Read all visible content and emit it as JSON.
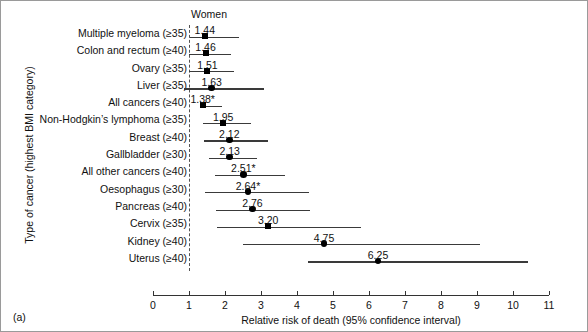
{
  "figure": {
    "panel_label": "(a)",
    "column_header": "Women",
    "y_axis_title": "Type of cancer (highest BMI category)",
    "x_axis_title": "Relative risk of death (95% confidence interval)"
  },
  "chart_data": {
    "type": "scatter",
    "title": "Women",
    "xlabel": "Relative risk of death (95% confidence interval)",
    "ylabel": "Type of cancer (highest BMI category)",
    "xlim": [
      0,
      11
    ],
    "xticks": [
      0,
      1,
      2,
      3,
      4,
      5,
      6,
      7,
      8,
      9,
      10,
      11
    ],
    "xtick_labels": [
      "0",
      "1",
      "2",
      "3",
      "4",
      "5",
      "6",
      "7",
      "8",
      "9",
      "10",
      "11"
    ],
    "grid": false,
    "legend": "none",
    "reference_line": 1.0,
    "categories": [
      "Multiple myeloma (≥35)",
      "Colon and rectum (≥40)",
      "Ovary (≥35)",
      "Liver (≥35)",
      "All cancers (≥40)",
      "Non-Hodgkin’s lymphoma (≥35)",
      "Breast (≥40)",
      "Gallbladder (≥30)",
      "All other cancers (≥40)",
      "Oesophagus (≥30)",
      "Pancreas (≥40)",
      "Cervix (≥35)",
      "Kidney (≥40)",
      "Uterus (≥40)"
    ],
    "points": [
      {
        "label": "Multiple myeloma (≥35)",
        "value": 1.44,
        "value_label": "1.44",
        "ci_low": 1.03,
        "ci_high": 2.39,
        "marker": "square"
      },
      {
        "label": "Colon and rectum (≥40)",
        "value": 1.46,
        "value_label": "1.46",
        "ci_low": 1.01,
        "ci_high": 2.16,
        "marker": "square"
      },
      {
        "label": "Ovary (≥35)",
        "value": 1.51,
        "value_label": "1.51",
        "ci_low": 1.01,
        "ci_high": 2.26,
        "marker": "square"
      },
      {
        "label": "Liver (≥35)",
        "value": 1.63,
        "value_label": "1.63",
        "ci_low": 0.87,
        "ci_high": 3.08,
        "marker": "circle"
      },
      {
        "label": "All cancers (≥40)",
        "value": 1.38,
        "value_label": "1.38*",
        "ci_low": 1.32,
        "ci_high": 1.91,
        "marker": "square"
      },
      {
        "label": "Non-Hodgkin’s lymphoma (≥35)",
        "value": 1.95,
        "value_label": "1.95",
        "ci_low": 1.39,
        "ci_high": 2.72,
        "marker": "square"
      },
      {
        "label": "Breast (≥40)",
        "value": 2.12,
        "value_label": "2.12",
        "ci_low": 1.41,
        "ci_high": 3.19,
        "marker": "circle"
      },
      {
        "label": "Gallbladder (≥30)",
        "value": 2.13,
        "value_label": "2.13",
        "ci_low": 1.56,
        "ci_high": 2.9,
        "marker": "circle"
      },
      {
        "label": "All other cancers (≥40)",
        "value": 2.51,
        "value_label": "2.51*",
        "ci_low": 1.71,
        "ci_high": 3.68,
        "marker": "circle"
      },
      {
        "label": "Oesophagus (≥30)",
        "value": 2.64,
        "value_label": "2.64*",
        "ci_low": 1.44,
        "ci_high": 4.34,
        "marker": "circle"
      },
      {
        "label": "Pancreas (≥40)",
        "value": 2.76,
        "value_label": "2.76",
        "ci_low": 1.74,
        "ci_high": 4.36,
        "marker": "circle"
      },
      {
        "label": "Cervix (≥35)",
        "value": 3.2,
        "value_label": "3.20",
        "ci_low": 1.77,
        "ci_high": 5.78,
        "marker": "square"
      },
      {
        "label": "Kidney (≥40)",
        "value": 4.75,
        "value_label": "4.75",
        "ci_low": 2.5,
        "ci_high": 9.07,
        "marker": "circle"
      },
      {
        "label": "Uterus (≥40)",
        "value": 6.25,
        "value_label": "6.25",
        "ci_low": 4.31,
        "ci_high": 10.41,
        "marker": "circle"
      }
    ]
  }
}
